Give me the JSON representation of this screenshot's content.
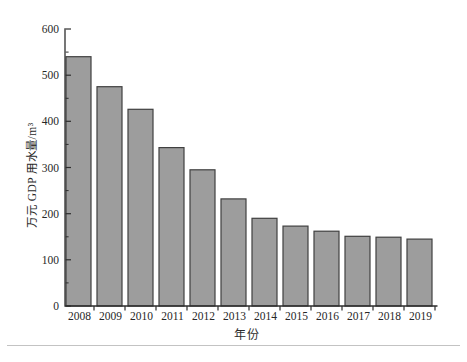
{
  "figure": {
    "background_color": "#ffffff",
    "separator_line_color": "#c3c3c3"
  },
  "chart_data": {
    "type": "bar",
    "title": "",
    "xlabel": "年份",
    "ylabel": "万元 GDP 用水量/m³",
    "categories": [
      "2008",
      "2009",
      "2010",
      "2011",
      "2012",
      "2013",
      "2014",
      "2015",
      "2016",
      "2017",
      "2018",
      "2019"
    ],
    "values": [
      540,
      475,
      426,
      343,
      295,
      232,
      190,
      173,
      162,
      151,
      149,
      145
    ],
    "ylim": [
      0,
      600
    ],
    "ytick_step": 100,
    "ytick_labels": [
      "0",
      "100",
      "200",
      "300",
      "400",
      "500",
      "600"
    ],
    "yminor_tick_step": 50,
    "grid": false,
    "legend": "none",
    "bar_fill_color": "#9d9d9d",
    "bar_stroke_color": "#404040",
    "axis_color": "#2e2e2e",
    "text_color": "#272727"
  }
}
